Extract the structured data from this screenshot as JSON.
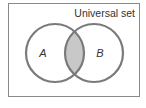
{
  "diagram": {
    "type": "venn",
    "universe": {
      "label": "Universal set"
    },
    "sets": [
      {
        "id": "A",
        "label": "A"
      },
      {
        "id": "B",
        "label": "B"
      }
    ],
    "highlighted_region": "A ∩ B",
    "colors": {
      "border": "#8a8a8a",
      "circle_stroke": "#7a7a7a",
      "intersection_fill": "#c8c8c8",
      "text": "#333333",
      "background": "#ffffff"
    }
  }
}
